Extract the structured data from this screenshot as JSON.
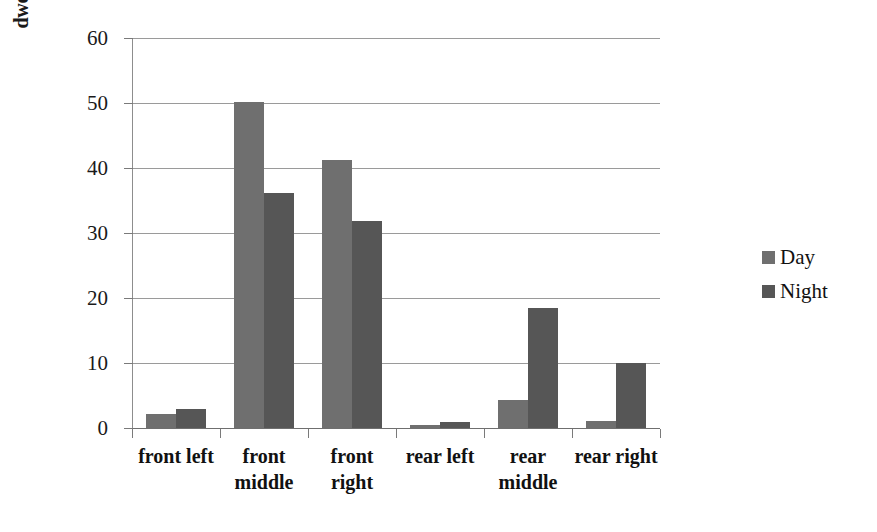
{
  "chart_data": {
    "type": "bar",
    "title": "",
    "xlabel": "",
    "ylabel": "dwell time percentage [%]",
    "ylim": [
      0,
      60
    ],
    "ytick_values": [
      60,
      50,
      40,
      30,
      20,
      10,
      0
    ],
    "ytick_labels": [
      "60",
      "50",
      "40",
      "30",
      "20",
      "10",
      "0"
    ],
    "grid": true,
    "legend_position": "right",
    "categories": [
      "front left",
      "front middle",
      "front right",
      "rear left",
      "rear middle",
      "rear right"
    ],
    "category_label_lines": [
      [
        "front left"
      ],
      [
        "front",
        "middle"
      ],
      [
        "front",
        "right"
      ],
      [
        "rear left"
      ],
      [
        "rear",
        "middle"
      ],
      [
        "rear right"
      ]
    ],
    "series": [
      {
        "name": "Day",
        "color": "#6f6f6f",
        "values": [
          2.1,
          50.1,
          41.3,
          0.5,
          4.3,
          1.1
        ]
      },
      {
        "name": "Night",
        "color": "#565656",
        "values": [
          2.9,
          36.1,
          31.9,
          0.9,
          18.5,
          10.0
        ]
      }
    ]
  },
  "legend": {
    "items": [
      {
        "label": "Day",
        "color": "#6f6f6f"
      },
      {
        "label": "Night",
        "color": "#565656"
      }
    ]
  },
  "colors": {
    "day": "#6f6f6f",
    "night": "#565656",
    "grid": "#9a9a9a",
    "axis": "#8d8d8d",
    "background": "#ffffff",
    "text": "#111111"
  }
}
